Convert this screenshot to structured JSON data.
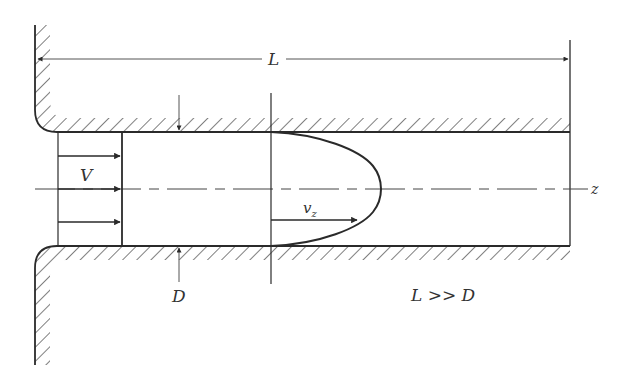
{
  "diagram": {
    "labels": {
      "length": "L",
      "uniform_velocity": "V",
      "axis": "z",
      "local_velocity": "v",
      "local_velocity_sub": "z",
      "diameter": "D",
      "condition": "L >> D"
    },
    "colors": {
      "line": "#2a2a2a",
      "thin_line": "#555555",
      "hatch": "#3a3a3a",
      "background": "#ffffff"
    },
    "geometry": {
      "reservoir_wall_x": 35,
      "pipe_top_y": 132,
      "pipe_bottom_y": 246,
      "centerline_y": 189,
      "pipe_inlet_x": 57,
      "pipe_outlet_x": 570,
      "uniform_profile_x": 122,
      "parabolic_profile_base_x": 271,
      "parabolic_profile_apex_x": 381,
      "dimension_line_y": 59,
      "diameter_marker_x": 179
    }
  }
}
